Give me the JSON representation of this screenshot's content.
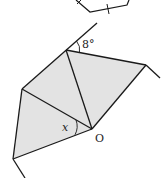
{
  "diagram": {
    "labels": {
      "angle_top": "8°",
      "angle_x": "x",
      "center": "O"
    },
    "colors": {
      "stroke": "#1a1a1a",
      "fill": "#e3e3e3",
      "background": "#ffffff"
    },
    "vertices": {
      "O": [
        92,
        129
      ],
      "A": [
        66,
        50
      ],
      "B": [
        146,
        65
      ],
      "C": [
        22,
        89
      ],
      "D": [
        13,
        159
      ]
    }
  }
}
